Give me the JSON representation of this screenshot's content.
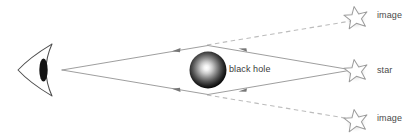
{
  "diagram": {
    "type": "physics-ray-diagram",
    "colors": {
      "background": "#ffffff",
      "ray_solid": "#8c8c8c",
      "ray_dashed": "#b9b9b9",
      "arrow": "#6e6e6e",
      "eye_outline": "#4a4a4a",
      "eye_pupil": "#101010",
      "star_outline": "#9a9a9a",
      "star_fill": "#ffffff",
      "star_shadow": "#cfcfcf",
      "black_hole_core": "#ffffff",
      "black_hole_edge": "#000000",
      "label_text": "#4a4a4a"
    },
    "labels": {
      "black_hole": "black hole",
      "image_top": "image",
      "star": "star",
      "image_bottom": "image"
    },
    "objects": {
      "observer": {
        "name": "eye",
        "x": 42,
        "y": 70
      },
      "black_hole": {
        "name": "black hole",
        "cx": 208,
        "cy": 70,
        "r": 18
      },
      "star_true": {
        "name": "star",
        "cx": 355,
        "cy": 70
      },
      "star_image_top": {
        "name": "image",
        "cx": 355,
        "cy": 17
      },
      "star_image_bottom": {
        "name": "image",
        "cx": 355,
        "cy": 120
      }
    },
    "rays": {
      "upper_path": "M 62,70 L 208,45 L 352,70",
      "lower_path": "M 62,70 L 208,95 L 352,70",
      "upper_dashed": "M 208,45 L 350,21",
      "lower_dashed": "M 208,95 L 350,119",
      "arrow_positions": [
        {
          "x": 177,
          "y": 48,
          "dir": "left"
        },
        {
          "x": 243,
          "y": 48,
          "dir": "left"
        },
        {
          "x": 177,
          "y": 92,
          "dir": "left"
        },
        {
          "x": 243,
          "y": 92,
          "dir": "left"
        }
      ]
    }
  }
}
